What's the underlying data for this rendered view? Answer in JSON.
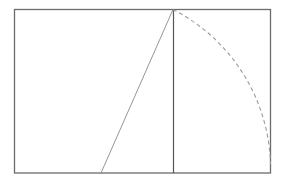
{
  "diagram": {
    "type": "golden-rectangle-construction",
    "colors": {
      "background": "#ffffff",
      "outline": "#6b6b6b",
      "divider": "#555555",
      "diagonal": "#8a8a8a",
      "arc": "#9a9a9a"
    },
    "rectangle": {
      "x1": 14,
      "y1": 9,
      "x2": 271,
      "y2": 173
    },
    "square_divider_x": 173,
    "diagonal": {
      "from": [
        101,
        173
      ],
      "to": [
        173,
        9
      ]
    },
    "arc": {
      "center": [
        101,
        173
      ],
      "start": [
        173,
        9
      ],
      "end": [
        271,
        164
      ],
      "style": "dashed"
    }
  }
}
